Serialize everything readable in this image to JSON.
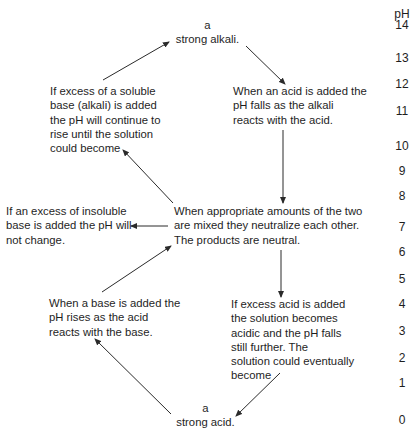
{
  "diagram": {
    "type": "pH change flow diagram",
    "scale": {
      "title": "pH",
      "values": [
        "14",
        "13",
        "12",
        "11",
        "10",
        "9",
        "8",
        "7",
        "6",
        "5",
        "4",
        "3",
        "2",
        "1",
        "0"
      ]
    },
    "nodes": {
      "strong_alkali": {
        "line1": "a",
        "line2": "strong alkali."
      },
      "soluble_base_excess": {
        "lines": [
          "If excess of a soluble",
          "base (alkali) is added",
          "the pH will continue to",
          "rise until the solution",
          "could become"
        ]
      },
      "acid_added": {
        "lines": [
          "When an acid is added the",
          "pH falls as the alkali",
          "reacts with the acid."
        ]
      },
      "insoluble_base_excess": {
        "lines": [
          "If an excess of insoluble",
          "base is added the pH will",
          "not change."
        ]
      },
      "neutralize": {
        "lines": [
          "When appropriate amounts of the two",
          "are mixed they neutralize each other.",
          "The products are neutral."
        ]
      },
      "base_added": {
        "lines": [
          "When a base is added the",
          "pH rises as the acid",
          "reacts with the base."
        ]
      },
      "excess_acid": {
        "lines": [
          "If excess acid is added",
          "the solution becomes",
          "acidic and the pH falls",
          "still further. The",
          "solution could eventually",
          "become"
        ]
      },
      "strong_acid": {
        "line1": "a",
        "line2": "strong acid."
      }
    },
    "edges": [
      {
        "from": "soluble_base_excess",
        "to": "strong_alkali"
      },
      {
        "from": "strong_alkali",
        "to": "acid_added"
      },
      {
        "from": "acid_added",
        "to": "neutralize"
      },
      {
        "from": "neutralize",
        "to": "soluble_base_excess"
      },
      {
        "from": "neutralize",
        "to": "insoluble_base_excess"
      },
      {
        "from": "base_added",
        "to": "neutralize"
      },
      {
        "from": "neutralize",
        "to": "excess_acid"
      },
      {
        "from": "excess_acid",
        "to": "strong_acid"
      },
      {
        "from": "strong_acid",
        "to": "base_added"
      }
    ]
  }
}
